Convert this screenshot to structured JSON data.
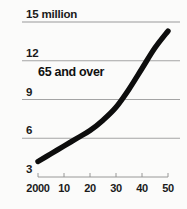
{
  "chart_data": {
    "type": "line",
    "title": "",
    "subtitle": "",
    "xlabel": "",
    "ylabel": "",
    "unit_note": "15 million",
    "series_label": "65 and over",
    "legend_position": "inside-upper-left",
    "grid": true,
    "grid_axis": "y",
    "xlim": [
      2000,
      2050
    ],
    "ylim": [
      3,
      15
    ],
    "x_tick_labels": [
      "2000",
      "10",
      "20",
      "30",
      "40",
      "50"
    ],
    "x_tick_values": [
      2000,
      2010,
      2020,
      2030,
      2040,
      2050
    ],
    "y_tick_labels": [
      "3",
      "6",
      "9",
      "12",
      "15 million"
    ],
    "y_tick_values": [
      3,
      6,
      9,
      12,
      15
    ],
    "series": [
      {
        "name": "65 and over",
        "color": "#0d0d0d",
        "x": [
          2000,
          2005,
          2010,
          2015,
          2020,
          2025,
          2030,
          2035,
          2040,
          2045,
          2050
        ],
        "values": [
          4.2,
          4.8,
          5.4,
          6.0,
          6.6,
          7.4,
          8.4,
          9.8,
          11.4,
          13.0,
          14.3
        ]
      }
    ]
  },
  "axes": {
    "y_labels": [
      {
        "text": "15 million",
        "value": 15
      },
      {
        "text": "12",
        "value": 12
      },
      {
        "text": "9",
        "value": 9
      },
      {
        "text": "6",
        "value": 6
      },
      {
        "text": "3",
        "value": 3
      }
    ],
    "x_labels": [
      {
        "text": "2000",
        "value": 2000
      },
      {
        "text": "10",
        "value": 2010
      },
      {
        "text": "20",
        "value": 2020
      },
      {
        "text": "30",
        "value": 2030
      },
      {
        "text": "40",
        "value": 2040
      },
      {
        "text": "50",
        "value": 2050
      }
    ]
  },
  "colors": {
    "background": "#fbfbfa",
    "line": "#0d0d0d",
    "grid": "#9a9a9a",
    "axis": "#8c8c8c",
    "text": "#1a1a1a"
  }
}
